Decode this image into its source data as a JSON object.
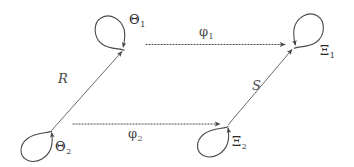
{
  "figure": {
    "kind": "commutative-diagram",
    "background_color": "#ffffff",
    "stroke_color": "#4a4a4a",
    "text_color": "#2b2b2b"
  },
  "nodes": [
    {
      "id": "theta1",
      "symbol": "Θ",
      "subscript": "1",
      "label": "Θ",
      "position": "top-left",
      "self_loop": "up-left"
    },
    {
      "id": "xi1",
      "symbol": "Ξ",
      "subscript": "1",
      "label": "Ξ",
      "position": "top-right",
      "self_loop": "up-right"
    },
    {
      "id": "theta2",
      "symbol": "Θ",
      "subscript": "2",
      "label": "Θ",
      "position": "bottom-left",
      "self_loop": "down-left"
    },
    {
      "id": "xi2",
      "symbol": "Ξ",
      "subscript": "2",
      "label": "Ξ",
      "position": "bottom-right",
      "self_loop": "down-left"
    }
  ],
  "edges": [
    {
      "id": "phi1",
      "symbol": "φ",
      "subscript": "1",
      "label": "φ",
      "from": "theta1",
      "to": "xi1",
      "style": "dotted",
      "arrowhead": "end"
    },
    {
      "id": "phi2",
      "symbol": "φ",
      "subscript": "2",
      "label": "φ",
      "from": "theta2",
      "to": "xi2",
      "style": "dotted",
      "arrowhead": "end"
    },
    {
      "id": "R",
      "symbol": "R",
      "subscript": "",
      "label": "R",
      "from": "theta2",
      "to": "theta1",
      "style": "solid",
      "arrowhead": "end"
    },
    {
      "id": "S",
      "symbol": "S",
      "subscript": "",
      "label": "S",
      "from": "xi2",
      "to": "xi1",
      "style": "solid",
      "arrowhead": "end"
    }
  ]
}
